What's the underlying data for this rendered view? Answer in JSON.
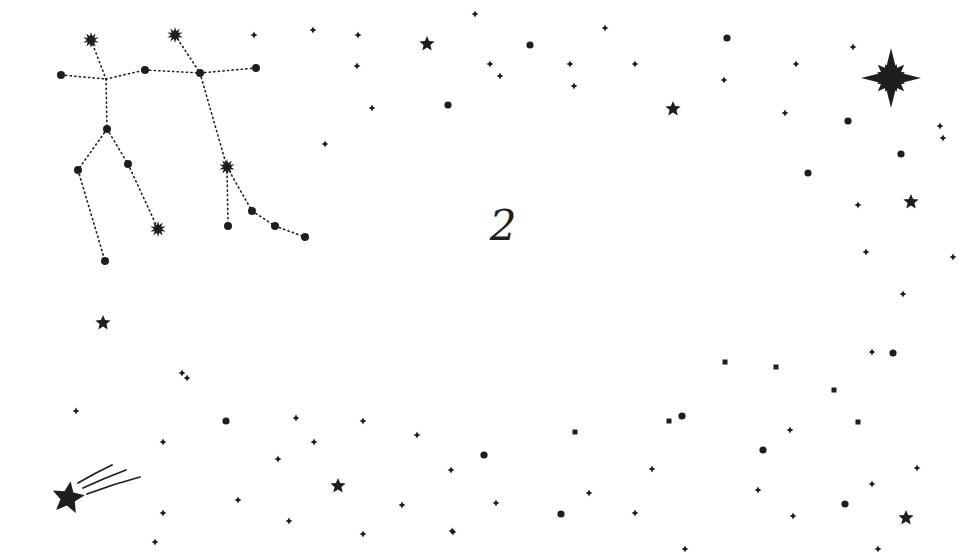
{
  "center_label": "2",
  "colors": {
    "ink": "#1e1e1e",
    "background": "#ffffff"
  },
  "constellation": {
    "name": "gemini",
    "nodes": [
      {
        "id": "castor",
        "x": 91,
        "y": 40,
        "type": "burst"
      },
      {
        "id": "pollux",
        "x": 175,
        "y": 35,
        "type": "burst"
      },
      {
        "id": "a1",
        "x": 61,
        "y": 75,
        "type": "dot"
      },
      {
        "id": "a2",
        "x": 106,
        "y": 79,
        "type": "none"
      },
      {
        "id": "a3",
        "x": 145,
        "y": 70,
        "type": "dot"
      },
      {
        "id": "a4",
        "x": 200,
        "y": 73,
        "type": "dot"
      },
      {
        "id": "a5",
        "x": 256,
        "y": 68,
        "type": "dot"
      },
      {
        "id": "b1",
        "x": 107,
        "y": 129,
        "type": "dot"
      },
      {
        "id": "b2",
        "x": 78,
        "y": 170,
        "type": "dot"
      },
      {
        "id": "b3",
        "x": 128,
        "y": 164,
        "type": "dot"
      },
      {
        "id": "b4",
        "x": 105,
        "y": 261,
        "type": "dot"
      },
      {
        "id": "b5",
        "x": 158,
        "y": 229,
        "type": "burst"
      },
      {
        "id": "c1",
        "x": 227,
        "y": 167,
        "type": "burst"
      },
      {
        "id": "c2",
        "x": 228,
        "y": 226,
        "type": "dot"
      },
      {
        "id": "c3",
        "x": 252,
        "y": 211,
        "type": "dot"
      },
      {
        "id": "c4",
        "x": 275,
        "y": 226,
        "type": "dot"
      },
      {
        "id": "c5",
        "x": 305,
        "y": 237,
        "type": "dot"
      }
    ],
    "edges": [
      [
        "castor",
        "a2"
      ],
      [
        "a1",
        "a2"
      ],
      [
        "a2",
        "a3"
      ],
      [
        "a3",
        "a4"
      ],
      [
        "a4",
        "a5"
      ],
      [
        "pollux",
        "a4"
      ],
      [
        "a2",
        "b1"
      ],
      [
        "b1",
        "b2"
      ],
      [
        "b2",
        "b4"
      ],
      [
        "b1",
        "b3"
      ],
      [
        "b3",
        "b5"
      ],
      [
        "a4",
        "c1"
      ],
      [
        "c1",
        "c2"
      ],
      [
        "c1",
        "c3"
      ],
      [
        "c3",
        "c4"
      ],
      [
        "c4",
        "c5"
      ]
    ]
  },
  "big_star": {
    "x": 891,
    "y": 78,
    "r": 30
  },
  "shooting_star": {
    "x": 68,
    "y": 498,
    "r": 17
  },
  "stars": [
    {
      "x": 427,
      "y": 44,
      "r": 8
    },
    {
      "x": 673,
      "y": 109,
      "r": 8
    },
    {
      "x": 911,
      "y": 202,
      "r": 8
    },
    {
      "x": 103,
      "y": 323,
      "r": 8
    },
    {
      "x": 338,
      "y": 486,
      "r": 8
    },
    {
      "x": 906,
      "y": 518,
      "r": 8
    }
  ],
  "dots": [
    {
      "x": 530,
      "y": 45
    },
    {
      "x": 727,
      "y": 38
    },
    {
      "x": 448,
      "y": 105
    },
    {
      "x": 848,
      "y": 121
    },
    {
      "x": 901,
      "y": 154
    },
    {
      "x": 808,
      "y": 173
    },
    {
      "x": 893,
      "y": 353
    },
    {
      "x": 226,
      "y": 421
    },
    {
      "x": 682,
      "y": 416
    },
    {
      "x": 484,
      "y": 455
    },
    {
      "x": 763,
      "y": 450
    },
    {
      "x": 561,
      "y": 514
    },
    {
      "x": 845,
      "y": 504
    }
  ],
  "diamonds": [
    {
      "x": 254,
      "y": 35
    },
    {
      "x": 313,
      "y": 30
    },
    {
      "x": 358,
      "y": 35
    },
    {
      "x": 475,
      "y": 14
    },
    {
      "x": 357,
      "y": 66
    },
    {
      "x": 490,
      "y": 64
    },
    {
      "x": 500,
      "y": 76
    },
    {
      "x": 605,
      "y": 28
    },
    {
      "x": 570,
      "y": 64
    },
    {
      "x": 574,
      "y": 86
    },
    {
      "x": 635,
      "y": 64
    },
    {
      "x": 724,
      "y": 80
    },
    {
      "x": 796,
      "y": 64
    },
    {
      "x": 785,
      "y": 113
    },
    {
      "x": 853,
      "y": 47
    },
    {
      "x": 372,
      "y": 108
    },
    {
      "x": 325,
      "y": 144
    },
    {
      "x": 940,
      "y": 126
    },
    {
      "x": 943,
      "y": 138
    },
    {
      "x": 858,
      "y": 205
    },
    {
      "x": 953,
      "y": 257
    },
    {
      "x": 866,
      "y": 252
    },
    {
      "x": 903,
      "y": 294
    },
    {
      "x": 872,
      "y": 352
    },
    {
      "x": 182,
      "y": 373
    },
    {
      "x": 187,
      "y": 378
    },
    {
      "x": 76,
      "y": 411
    },
    {
      "x": 296,
      "y": 418
    },
    {
      "x": 363,
      "y": 421
    },
    {
      "x": 163,
      "y": 442
    },
    {
      "x": 314,
      "y": 442
    },
    {
      "x": 417,
      "y": 435
    },
    {
      "x": 278,
      "y": 459
    },
    {
      "x": 451,
      "y": 470
    },
    {
      "x": 652,
      "y": 469
    },
    {
      "x": 790,
      "y": 430
    },
    {
      "x": 917,
      "y": 468
    },
    {
      "x": 238,
      "y": 500
    },
    {
      "x": 402,
      "y": 505
    },
    {
      "x": 496,
      "y": 503
    },
    {
      "x": 589,
      "y": 493
    },
    {
      "x": 758,
      "y": 490
    },
    {
      "x": 872,
      "y": 484
    },
    {
      "x": 163,
      "y": 513
    },
    {
      "x": 289,
      "y": 521
    },
    {
      "x": 363,
      "y": 534
    },
    {
      "x": 453,
      "y": 532
    },
    {
      "x": 635,
      "y": 513
    },
    {
      "x": 793,
      "y": 516
    },
    {
      "x": 155,
      "y": 542
    },
    {
      "x": 452,
      "y": 531
    },
    {
      "x": 685,
      "y": 549
    },
    {
      "x": 878,
      "y": 549
    }
  ],
  "squares": [
    {
      "x": 575,
      "y": 432
    },
    {
      "x": 669,
      "y": 421
    },
    {
      "x": 725,
      "y": 362
    },
    {
      "x": 776,
      "y": 367
    },
    {
      "x": 834,
      "y": 390
    },
    {
      "x": 858,
      "y": 422
    }
  ]
}
